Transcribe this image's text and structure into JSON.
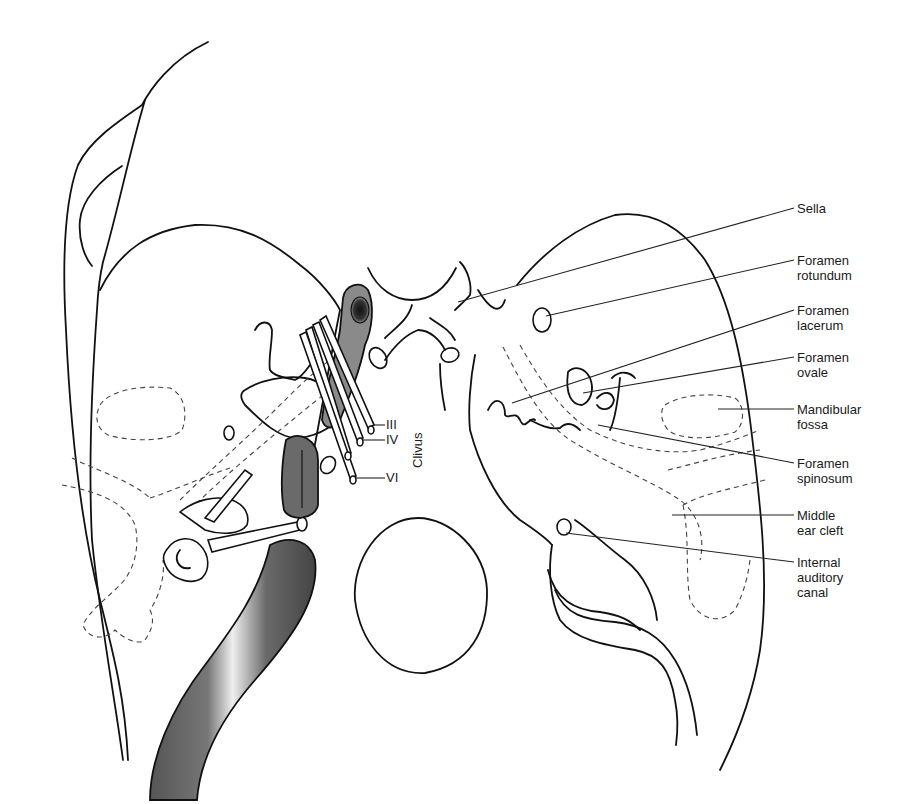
{
  "figure": {
    "type": "anatomical-diagram",
    "colors": {
      "line": "#111111",
      "vessel_fill": "#5a5a5a",
      "vessel_highlight": "#f0f0f0",
      "background": "#ffffff"
    }
  },
  "labels": {
    "sella": "Sella",
    "foramen_rotundum": "Foramen\nrotundum",
    "foramen_lacerum": "Foramen\nlacerum",
    "foramen_ovale": "Foramen\novale",
    "mandibular_fossa": "Mandibular\nfossa",
    "foramen_spinosum": "Foramen\nspinosum",
    "middle_ear_cleft": "Middle\near cleft",
    "internal_auditory_canal": "Internal\nauditory\ncanal",
    "clivus": "Clivus"
  },
  "nerves": {
    "iii": "III",
    "iv": "IV",
    "vi": "VI"
  }
}
